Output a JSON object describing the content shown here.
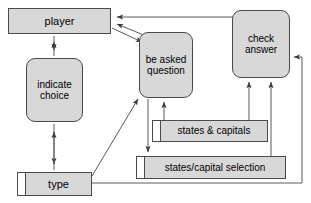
{
  "diagram": {
    "type": "uml-collaboration-diagram",
    "fill_color": "#d8d8d8",
    "line_color": "#4a4a4a",
    "background_color": "#ffffff",
    "nodes": [
      {
        "id": "player",
        "label": "player",
        "shape": "rectangle",
        "x": 8,
        "y": 8,
        "w": 103,
        "h": 26,
        "font_size": 11
      },
      {
        "id": "indicate_choice",
        "label": "indicate\nchoice",
        "shape": "rounded-rectangle",
        "x": 26,
        "y": 58,
        "w": 57,
        "h": 64,
        "font_size": 10
      },
      {
        "id": "type",
        "label": "type",
        "shape": "object-rectangle",
        "x": 17,
        "y": 172,
        "w": 75,
        "h": 24,
        "font_size": 11
      },
      {
        "id": "be_asked_question",
        "label": "be asked\nquestion",
        "shape": "rounded-rectangle",
        "x": 139,
        "y": 32,
        "w": 54,
        "h": 66,
        "font_size": 10
      },
      {
        "id": "check_answer",
        "label": "check\nanswer",
        "shape": "rounded-rectangle",
        "x": 232,
        "y": 10,
        "w": 58,
        "h": 68,
        "font_size": 10
      },
      {
        "id": "states_capitals",
        "label": "states & capitals",
        "shape": "object-rectangle",
        "x": 152,
        "y": 120,
        "w": 116,
        "h": 22,
        "font_size": 10
      },
      {
        "id": "states_selection",
        "label": "states/capital selection",
        "shape": "object-rectangle",
        "x": 136,
        "y": 156,
        "w": 150,
        "h": 23,
        "font_size": 10
      }
    ],
    "edges": [
      {
        "id": "check-to-player",
        "from": "check_answer",
        "to": "player",
        "arrows": "one-way"
      },
      {
        "id": "player-beasked",
        "from": "player",
        "to": "be_asked_question",
        "arrows": "two-way"
      },
      {
        "id": "player-indicate-choice",
        "from": "player",
        "to": "indicate_choice",
        "arrows": "two-way"
      },
      {
        "id": "indicate-choice-type",
        "from": "indicate_choice",
        "to": "type",
        "arrows": "two-way"
      },
      {
        "id": "type-to-beasked",
        "from": "type",
        "to": "be_asked_question",
        "arrows": "one-way"
      },
      {
        "id": "beasked-to-selection",
        "from": "be_asked_question",
        "to": "states_selection",
        "arrows": "one-way"
      },
      {
        "id": "states-capitals-to-beasked",
        "from": "states_capitals",
        "to": "be_asked_question",
        "arrows": "one-way"
      },
      {
        "id": "states-capitals-to-check",
        "from": "states_capitals",
        "to": "check_answer",
        "arrows": "one-way"
      },
      {
        "id": "selection-to-check",
        "from": "states_selection",
        "to": "check_answer",
        "arrows": "one-way"
      },
      {
        "id": "type-to-check",
        "from": "type",
        "to": "check_answer",
        "arrows": "one-way"
      }
    ]
  }
}
